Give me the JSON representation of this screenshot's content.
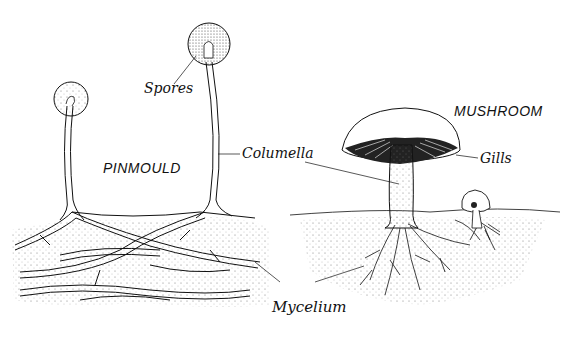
{
  "diagram": {
    "subjects": [
      {
        "id": "pinmould",
        "title": "PINMOULD"
      },
      {
        "id": "mushroom",
        "title": "MUSHROOM"
      }
    ],
    "labels": {
      "spores": "Spores",
      "columella": "Columella",
      "gills": "Gills",
      "mycelium": "Mycelium"
    },
    "colors": {
      "ink": "#111111",
      "background": "#ffffff",
      "stipple": "#555555"
    }
  }
}
